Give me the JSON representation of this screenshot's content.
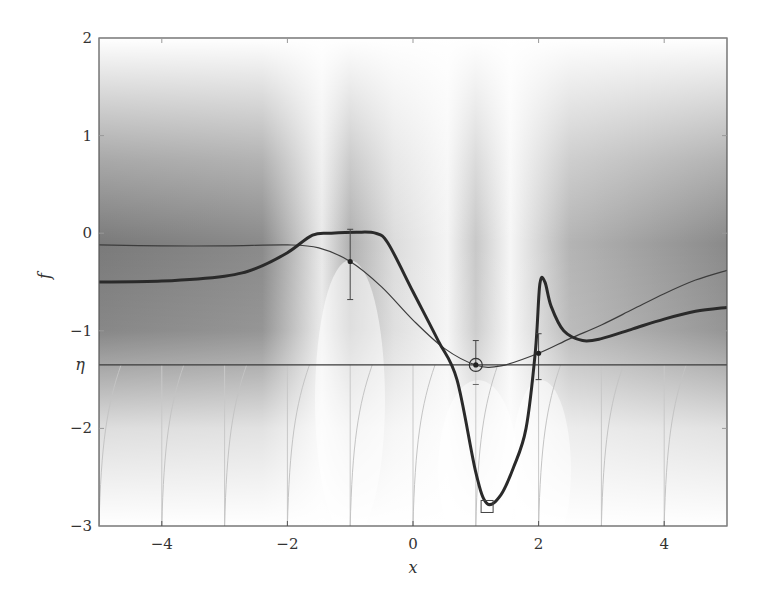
{
  "chart_data": {
    "type": "line",
    "title": "",
    "xlabel": "x",
    "ylabel": "f",
    "xlim": [
      -5,
      5
    ],
    "ylim": [
      -3,
      2
    ],
    "xticks": [
      -4,
      -2,
      0,
      2,
      4
    ],
    "xtick_labels": [
      "−4",
      "−2",
      "0",
      "2",
      "4"
    ],
    "yticks": [
      2,
      1,
      0,
      -1,
      -2,
      -3
    ],
    "ytick_labels": [
      "2",
      "1",
      "0",
      "−1",
      "−2",
      "−3"
    ],
    "threshold": {
      "label": "η",
      "value": -1.35
    },
    "grid": false,
    "legend": null,
    "series": [
      {
        "name": "posterior mean",
        "style": "thin",
        "x": [
          -5,
          -4,
          -3,
          -2,
          -1.5,
          -1,
          -0.5,
          0,
          0.5,
          1.0,
          1.4,
          2.0,
          2.5,
          3.0,
          3.5,
          4.0,
          4.5,
          5.0
        ],
        "y": [
          -0.12,
          -0.13,
          -0.13,
          -0.12,
          -0.15,
          -0.29,
          -0.55,
          -0.89,
          -1.18,
          -1.35,
          -1.36,
          -1.23,
          -1.08,
          -0.94,
          -0.78,
          -0.62,
          -0.48,
          -0.38
        ]
      },
      {
        "name": "acquisition (expected improvement)",
        "style": "thick",
        "x": [
          -5,
          -4,
          -3,
          -2.5,
          -2,
          -1.6,
          -1.3,
          -0.9,
          -0.6,
          -0.4,
          0,
          0.4,
          0.7,
          1.0,
          1.18,
          1.4,
          1.6,
          1.8,
          1.95,
          2.02,
          2.1,
          2.2,
          2.4,
          2.7,
          3.0,
          3.5,
          4.0,
          4.5,
          5.0
        ],
        "y": [
          -0.5,
          -0.49,
          -0.44,
          -0.36,
          -0.2,
          -0.02,
          0.0,
          0.01,
          0.0,
          -0.1,
          -0.6,
          -1.1,
          -1.5,
          -2.45,
          -2.77,
          -2.68,
          -2.4,
          -2.0,
          -1.2,
          -0.52,
          -0.5,
          -0.75,
          -1.0,
          -1.1,
          -1.08,
          -0.98,
          -0.88,
          -0.8,
          -0.76
        ]
      }
    ],
    "observations": [
      {
        "x": -1,
        "y": -0.29,
        "err_low": -0.68,
        "err_high": 0.04
      },
      {
        "x": 1,
        "y": -1.35,
        "err_low": null,
        "err_high": -1.1,
        "marker": "circle-highlight"
      },
      {
        "x": 2,
        "y": -1.23,
        "err_low": -1.5,
        "err_high": -1.03
      }
    ],
    "proposal": {
      "x": 1.18,
      "y": -2.8,
      "marker": "square"
    },
    "lower_ticks": {
      "x": [
        -5,
        -4,
        -3,
        -2,
        -1,
        0,
        1,
        2,
        3,
        4
      ]
    },
    "uncertainty_band": {
      "note": "grey shading: posterior variance, narrows to white at observations x=-1, 1, 2"
    }
  }
}
